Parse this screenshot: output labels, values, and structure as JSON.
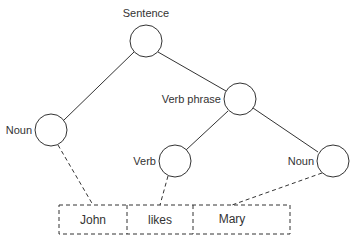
{
  "diagram": {
    "type": "parse-tree",
    "colors": {
      "line": "#333333",
      "background": "#ffffff",
      "text": "#333333"
    },
    "nodes": [
      {
        "id": "sentence",
        "label": "Sentence",
        "cx": 146,
        "cy": 41
      },
      {
        "id": "noun1",
        "label": "Noun",
        "cx": 51,
        "cy": 130
      },
      {
        "id": "verb_phrase",
        "label": "Verb phrase",
        "cx": 240,
        "cy": 99
      },
      {
        "id": "verb",
        "label": "Verb",
        "cx": 175,
        "cy": 161
      },
      {
        "id": "noun2",
        "label": "Noun",
        "cx": 333,
        "cy": 161
      }
    ],
    "edges": [
      {
        "from": "sentence",
        "to": "noun1",
        "style": "solid"
      },
      {
        "from": "sentence",
        "to": "verb_phrase",
        "style": "solid"
      },
      {
        "from": "verb_phrase",
        "to": "verb",
        "style": "solid"
      },
      {
        "from": "verb_phrase",
        "to": "noun2",
        "style": "solid"
      }
    ],
    "words": [
      {
        "id": "john",
        "text": "John"
      },
      {
        "id": "likes",
        "text": "likes"
      },
      {
        "id": "mary",
        "text": "Mary"
      }
    ],
    "links": [
      {
        "from": "noun1",
        "to": "john",
        "style": "dashed"
      },
      {
        "from": "verb",
        "to": "likes",
        "style": "dashed"
      },
      {
        "from": "noun2",
        "to": "mary",
        "style": "dashed"
      }
    ]
  }
}
